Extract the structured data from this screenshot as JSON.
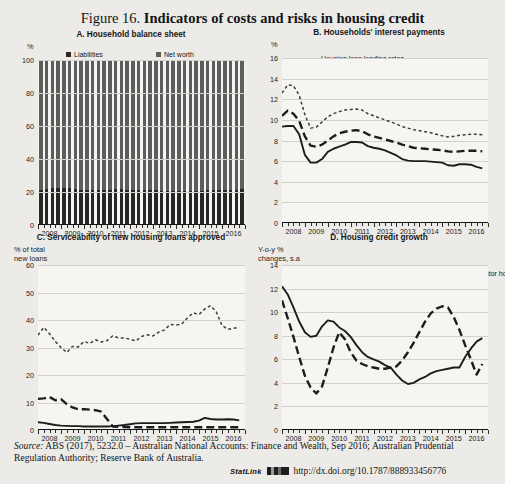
{
  "top_ghost_text": "",
  "figure": {
    "number": "Figure 16.",
    "title": "Indicators of costs and risks in housing credit"
  },
  "source": {
    "label": "Source:",
    "text": " ABS (2017), 5232.0 – Australian National Accounts: Finance and Wealth, Sep 2016; Australian Prudential Regulation Authority; Reserve Bank of Australia."
  },
  "statlink": {
    "label": "StatLink",
    "url": "http://dx.doi.org/10.1787/888933456776"
  },
  "chart_data": [
    {
      "id": "A",
      "type": "bar",
      "title": "A. Household balance sheet",
      "ylabel": "%",
      "xlabel": "",
      "ylim": [
        0,
        100
      ],
      "yticks": [
        0,
        20,
        40,
        60,
        80,
        100
      ],
      "xticks": [
        "2008",
        "2009",
        "2010",
        "2011",
        "2012",
        "2013",
        "2014",
        "2015",
        "2016"
      ],
      "grid": true,
      "stacked": true,
      "legend_position": "top",
      "colors": {
        "liabilities": "#272727",
        "net_worth": "#5d5d5d"
      },
      "categories": [
        "2008Q1",
        "2008Q2",
        "2008Q3",
        "2008Q4",
        "2009Q1",
        "2009Q2",
        "2009Q3",
        "2009Q4",
        "2010Q1",
        "2010Q2",
        "2010Q3",
        "2010Q4",
        "2011Q1",
        "2011Q2",
        "2011Q3",
        "2011Q4",
        "2012Q1",
        "2012Q2",
        "2012Q3",
        "2012Q4",
        "2013Q1",
        "2013Q2",
        "2013Q3",
        "2013Q4",
        "2014Q1",
        "2014Q2",
        "2014Q3",
        "2014Q4",
        "2015Q1",
        "2015Q2",
        "2015Q3",
        "2015Q4",
        "2016Q1",
        "2016Q2",
        "2016Q3",
        "2016Q4"
      ],
      "series": [
        {
          "name": "Liabilities",
          "values": [
            21.0,
            21.6,
            22.2,
            22.6,
            22.5,
            22.3,
            21.9,
            21.5,
            21.3,
            21.2,
            21.3,
            21.4,
            21.5,
            21.6,
            21.6,
            21.5,
            21.4,
            21.3,
            21.2,
            21.1,
            21.0,
            20.9,
            20.8,
            20.7,
            20.6,
            20.6,
            20.7,
            20.8,
            20.9,
            21.0,
            21.1,
            21.2,
            21.3,
            21.4,
            21.5,
            21.6
          ]
        },
        {
          "name": "Net worth",
          "values": [
            79.0,
            78.4,
            77.8,
            77.4,
            77.5,
            77.7,
            78.1,
            78.5,
            78.7,
            78.8,
            78.7,
            78.6,
            78.5,
            78.4,
            78.4,
            78.5,
            78.6,
            78.7,
            78.8,
            78.9,
            79.0,
            79.1,
            79.2,
            79.3,
            79.4,
            79.4,
            79.3,
            79.2,
            79.1,
            79.0,
            78.9,
            78.8,
            78.7,
            78.6,
            78.5,
            78.4
          ]
        }
      ]
    },
    {
      "id": "B",
      "type": "line",
      "title": "B. Households' interest payments",
      "ylabel": "%",
      "xlabel": "",
      "ylim": [
        0,
        16
      ],
      "yticks": [
        0,
        2,
        4,
        6,
        8,
        10,
        12,
        14,
        16
      ],
      "xticks": [
        "2008",
        "2009",
        "2010",
        "2011",
        "2012",
        "2013",
        "2014",
        "2015",
        "2016"
      ],
      "grid": true,
      "legend_position": "top-left",
      "x": [
        2008.0,
        2008.25,
        2008.5,
        2008.75,
        2009.0,
        2009.25,
        2009.5,
        2009.75,
        2010.0,
        2010.25,
        2010.5,
        2010.75,
        2011.0,
        2011.25,
        2011.5,
        2011.75,
        2012.0,
        2012.25,
        2012.5,
        2012.75,
        2013.0,
        2013.25,
        2013.5,
        2013.75,
        2014.0,
        2014.25,
        2014.5,
        2014.75,
        2015.0,
        2015.25,
        2015.5,
        2015.75,
        2016.0,
        2016.25,
        2016.5,
        2016.75
      ],
      "series": [
        {
          "name": "Housing loan lending rates",
          "style": "solid",
          "values": [
            9.35,
            9.4,
            9.4,
            8.6,
            6.6,
            5.85,
            5.85,
            6.2,
            6.9,
            7.2,
            7.4,
            7.6,
            7.85,
            7.85,
            7.8,
            7.45,
            7.3,
            7.2,
            7.05,
            6.8,
            6.55,
            6.2,
            6.05,
            6.0,
            6.0,
            6.0,
            5.95,
            5.9,
            5.85,
            5.6,
            5.55,
            5.7,
            5.7,
            5.65,
            5.45,
            5.3
          ]
        },
        {
          "name": "Interest payments to disposable income (total)",
          "style": "dotted",
          "values": [
            12.6,
            13.4,
            13.3,
            12.4,
            10.5,
            9.2,
            9.3,
            9.8,
            10.3,
            10.6,
            10.8,
            10.95,
            11.0,
            11.05,
            10.95,
            10.6,
            10.4,
            10.2,
            10.0,
            9.8,
            9.6,
            9.35,
            9.2,
            9.05,
            8.95,
            8.85,
            8.75,
            8.6,
            8.45,
            8.35,
            8.4,
            8.5,
            8.55,
            8.6,
            8.6,
            8.55
          ]
        },
        {
          "name": "Interest payments to disposable income (housing)",
          "style": "dashed",
          "values": [
            10.4,
            10.9,
            10.6,
            9.9,
            8.4,
            7.5,
            7.4,
            7.6,
            8.0,
            8.4,
            8.7,
            8.85,
            8.95,
            9.0,
            8.9,
            8.6,
            8.4,
            8.25,
            8.1,
            7.95,
            7.8,
            7.6,
            7.45,
            7.3,
            7.25,
            7.2,
            7.15,
            7.1,
            7.05,
            6.95,
            6.9,
            6.95,
            7.0,
            7.0,
            7.0,
            6.95
          ]
        }
      ]
    },
    {
      "id": "C",
      "type": "line",
      "title": "C. Serviceability of new housing loans approved",
      "ylabel": "% of total new loans",
      "xlabel": "",
      "ylim": [
        0,
        60
      ],
      "yticks": [
        0,
        10,
        20,
        30,
        40,
        50,
        60
      ],
      "xticks": [
        "2008",
        "2009",
        "2010",
        "2011",
        "2012",
        "2013",
        "2014",
        "2015",
        "2016"
      ],
      "grid": true,
      "legend_position": "top",
      "x": [
        2008.0,
        2008.25,
        2008.5,
        2008.75,
        2009.0,
        2009.25,
        2009.5,
        2009.75,
        2010.0,
        2010.25,
        2010.5,
        2010.75,
        2011.0,
        2011.25,
        2011.5,
        2011.75,
        2012.0,
        2012.25,
        2012.5,
        2012.75,
        2013.0,
        2013.25,
        2013.5,
        2013.75,
        2014.0,
        2014.25,
        2014.5,
        2014.75,
        2015.0,
        2015.25,
        2015.5,
        2015.75,
        2016.0,
        2016.25,
        2016.5,
        2016.75
      ],
      "series": [
        {
          "name": "Loans approved outside serviceability",
          "style": "solid",
          "values": [
            2.8,
            2.6,
            2.2,
            1.8,
            1.6,
            1.5,
            1.4,
            1.4,
            1.3,
            1.3,
            1.3,
            1.3,
            1.3,
            1.4,
            1.6,
            1.8,
            2.1,
            2.4,
            2.5,
            2.5,
            2.5,
            2.5,
            2.5,
            2.6,
            2.7,
            2.8,
            2.9,
            3.0,
            3.4,
            4.4,
            4.0,
            3.8,
            3.8,
            3.9,
            3.8,
            3.5
          ]
        },
        {
          "name": "Interest-only loans",
          "style": "dotted",
          "values": [
            34.5,
            37.3,
            35.0,
            32.2,
            30.0,
            28.2,
            30.4,
            30.2,
            32.2,
            31.5,
            32.8,
            32.0,
            32.5,
            34.2,
            33.5,
            33.5,
            33.0,
            32.4,
            34.0,
            34.6,
            34.2,
            35.6,
            36.4,
            38.4,
            38.2,
            38.5,
            40.8,
            42.6,
            42.0,
            44.0,
            45.2,
            43.0,
            38.0,
            36.6,
            37.0,
            37.4
          ]
        },
        {
          "name": "Low-documentation loans",
          "style": "dashed",
          "values": [
            11.3,
            11.5,
            12.0,
            10.8,
            11.2,
            9.4,
            8.2,
            7.5,
            7.6,
            7.4,
            7.2,
            6.7,
            4.0,
            1.3,
            1.2,
            1.1,
            1.0,
            1.0,
            1.0,
            1.0,
            1.0,
            1.0,
            1.0,
            1.0,
            1.0,
            1.0,
            1.0,
            1.0,
            1.0,
            1.0,
            1.0,
            1.0,
            1.0,
            1.0,
            1.0,
            1.0
          ]
        }
      ]
    },
    {
      "id": "D",
      "type": "line",
      "title": "D. Housing credit growth",
      "ylabel": "Y-o-y % changes, s.a",
      "xlabel": "",
      "ylim": [
        0,
        14
      ],
      "yticks": [
        0,
        2,
        4,
        6,
        8,
        10,
        12,
        14
      ],
      "xticks": [
        "2008",
        "2009",
        "2010",
        "2011",
        "2012",
        "2013",
        "2014",
        "2015",
        "2016"
      ],
      "grid": true,
      "legend_position": "top",
      "x": [
        2008.0,
        2008.25,
        2008.5,
        2008.75,
        2009.0,
        2009.25,
        2009.5,
        2009.75,
        2010.0,
        2010.25,
        2010.5,
        2010.75,
        2011.0,
        2011.25,
        2011.5,
        2011.75,
        2012.0,
        2012.25,
        2012.5,
        2012.75,
        2013.0,
        2013.25,
        2013.5,
        2013.75,
        2014.0,
        2014.25,
        2014.5,
        2014.75,
        2015.0,
        2015.25,
        2015.5,
        2015.75,
        2016.0,
        2016.25,
        2016.5,
        2016.75
      ],
      "series": [
        {
          "name": "Owner-occupier housing",
          "style": "solid",
          "values": [
            12.2,
            11.5,
            10.4,
            9.2,
            8.3,
            7.9,
            8.0,
            8.8,
            9.3,
            9.2,
            8.7,
            8.4,
            7.9,
            7.2,
            6.6,
            6.2,
            6.0,
            5.8,
            5.5,
            5.3,
            4.7,
            4.2,
            3.9,
            4.0,
            4.3,
            4.5,
            4.8,
            5.0,
            5.1,
            5.2,
            5.3,
            5.3,
            6.2,
            6.9,
            7.5,
            7.8
          ]
        },
        {
          "name": "Investor housing",
          "style": "dashed",
          "values": [
            11.0,
            9.5,
            7.9,
            6.2,
            4.6,
            3.6,
            3.1,
            3.7,
            5.3,
            7.0,
            8.3,
            7.7,
            6.6,
            5.9,
            5.6,
            5.4,
            5.3,
            5.2,
            5.2,
            5.3,
            5.4,
            5.9,
            6.6,
            7.4,
            8.3,
            9.2,
            9.9,
            10.3,
            10.5,
            10.4,
            9.6,
            8.5,
            7.2,
            6.0,
            4.7,
            5.6
          ]
        }
      ]
    }
  ]
}
